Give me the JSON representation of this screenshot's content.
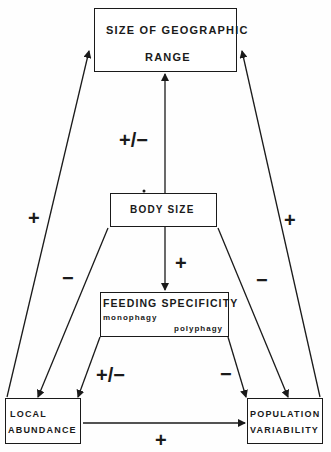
{
  "nodes": {
    "range": {
      "line1": "SIZE OF GEOGRAPHIC",
      "line2": "RANGE"
    },
    "body_size": {
      "label": "BODY SIZE"
    },
    "feeding": {
      "label": "FEEDING SPECIFICITY",
      "from": "monophagy",
      "to": "polyphagy"
    },
    "abundance": {
      "line1": "LOCAL",
      "line2": "ABUNDANCE"
    },
    "variability": {
      "line1": "POPULATION",
      "line2": "VARIABILITY"
    }
  },
  "edges": [
    {
      "from": "body_size",
      "to": "range",
      "sign": "+/−"
    },
    {
      "from": "body_size",
      "to": "feeding",
      "sign": "+"
    },
    {
      "from": "body_size",
      "to": "abundance",
      "sign": "−"
    },
    {
      "from": "body_size",
      "to": "variability",
      "sign": "−"
    },
    {
      "from": "feeding",
      "to": "abundance",
      "sign": "+/−"
    },
    {
      "from": "feeding",
      "to": "variability",
      "sign": "−"
    },
    {
      "from": "abundance",
      "to": "range",
      "sign": "+"
    },
    {
      "from": "variability",
      "to": "range",
      "sign": "+"
    },
    {
      "from": "abundance",
      "to": "variability",
      "sign": "+"
    }
  ]
}
